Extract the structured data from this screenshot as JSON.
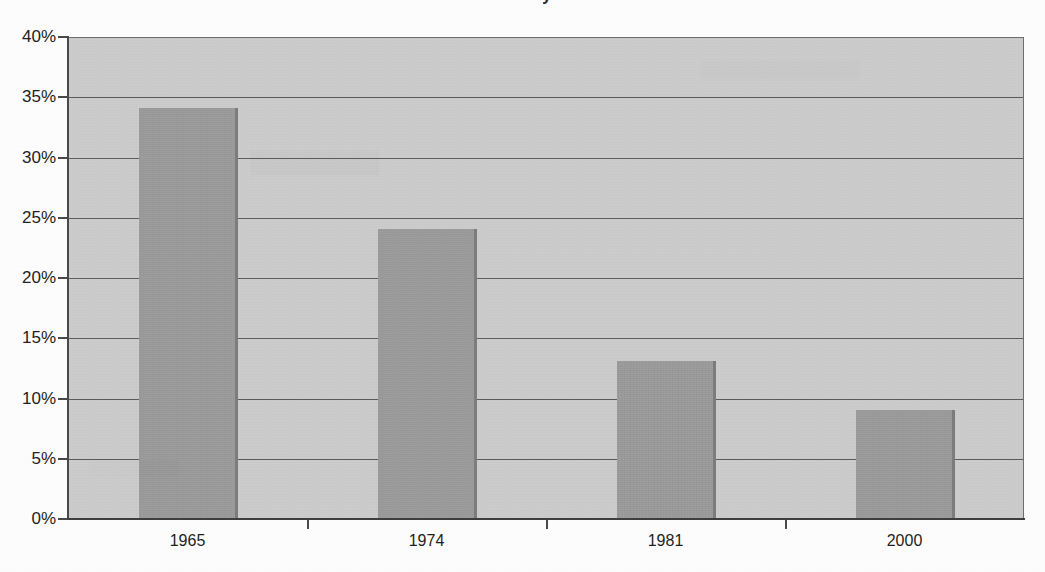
{
  "chart_data": {
    "type": "bar",
    "title": "",
    "subtitle": "",
    "xlabel": "",
    "ylabel": "",
    "categories": [
      "1965",
      "1974",
      "1981",
      "2000"
    ],
    "values": [
      34,
      24,
      13,
      9
    ],
    "value_labels": [
      "34%",
      "24%",
      "13%",
      "9%"
    ],
    "series": [
      {
        "name": "",
        "values": [
          34,
          24,
          13,
          9
        ]
      }
    ],
    "ylim": [
      0,
      40
    ],
    "ytick_values": [
      40,
      35,
      30,
      25,
      20,
      15,
      10,
      5,
      0
    ],
    "ytick_labels": [
      "40%",
      "35%",
      "30%",
      "25%",
      "20%",
      "15%",
      "10%",
      "5%",
      "0%"
    ],
    "grid": true,
    "grid_axis": "y",
    "legend": false,
    "legend_position": "none",
    "annotations": [],
    "bar_color": "#9a9a9a",
    "plot_background_color": "#cacaca",
    "gridline_color": "#5d5d5d",
    "axis_color": "#4a4a4a",
    "text_color": "#232323",
    "page_background_color": "#fdfdfd"
  },
  "axes": {
    "y": {
      "ticks": [
        {
          "label": "40%",
          "value": 40
        },
        {
          "label": "35%",
          "value": 35
        },
        {
          "label": "30%",
          "value": 30
        },
        {
          "label": "25%",
          "value": 25
        },
        {
          "label": "20%",
          "value": 20
        },
        {
          "label": "15%",
          "value": 15
        },
        {
          "label": "10%",
          "value": 10
        },
        {
          "label": "5%",
          "value": 5
        },
        {
          "label": "0%",
          "value": 0
        }
      ]
    },
    "x": {
      "ticks": [
        {
          "label": "1965"
        },
        {
          "label": "1974"
        },
        {
          "label": "1981"
        },
        {
          "label": "2000"
        }
      ]
    }
  },
  "title_fragment": {
    "text": "y"
  }
}
